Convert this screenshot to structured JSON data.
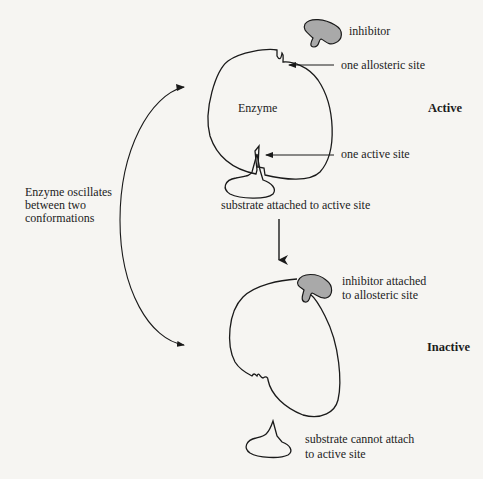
{
  "diagram": {
    "type": "allosteric-inhibition",
    "colors": {
      "background": "#f6f5f2",
      "stroke": "#1a1a1a",
      "inhibitor_fill": "#a9a9a9"
    },
    "labels": {
      "inhibitor": "inhibitor",
      "allosteric_site": "one allosteric site",
      "enzyme": "Enzyme",
      "active_state": "Active",
      "active_site": "one active site",
      "substrate_attached": "substrate attached to active site",
      "oscillation_line1": "Enzyme oscillates",
      "oscillation_line2": "between two",
      "oscillation_line3": "conformations",
      "inhibitor_attached_line1": "inhibitor attached",
      "inhibitor_attached_line2": "to allosteric site",
      "inactive_state": "Inactive",
      "substrate_cannot_line1": "substrate cannot attach",
      "substrate_cannot_line2": "to active site"
    },
    "nodes": [
      {
        "id": "inhibitor-free",
        "shape": "blob",
        "fill": "#a9a9a9"
      },
      {
        "id": "enzyme-active",
        "shape": "closed-curve",
        "features": [
          "allosteric-notch",
          "active-site-notch"
        ]
      },
      {
        "id": "substrate-bound",
        "shape": "ellipse-with-spike"
      },
      {
        "id": "enzyme-inactive",
        "shape": "closed-curve",
        "features": [
          "inhibitor-bound",
          "distorted-active-site"
        ]
      },
      {
        "id": "substrate-free",
        "shape": "ellipse-with-spike"
      }
    ],
    "edges": [
      {
        "from": "enzyme-active",
        "to": "enzyme-inactive",
        "type": "arrow-down"
      },
      {
        "from": "oscillation",
        "to": "enzyme-active",
        "type": "curved-double-arrow"
      },
      {
        "from": "oscillation",
        "to": "enzyme-inactive",
        "type": "curved-double-arrow"
      }
    ]
  }
}
